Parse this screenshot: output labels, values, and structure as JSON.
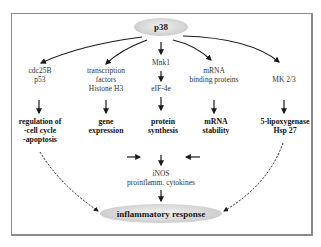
{
  "diagram": {
    "root": {
      "label": "p38"
    },
    "branches": [
      {
        "id": "cdc25b",
        "lines": [
          "cdc25B",
          "p53"
        ]
      },
      {
        "id": "tf",
        "lines": [
          "transcription",
          "factors",
          "Histone H3"
        ]
      },
      {
        "id": "mnk1",
        "lines": [
          "Mnk1"
        ]
      },
      {
        "id": "mrna-bp",
        "lines": [
          "mRNA",
          "binding proteins"
        ]
      },
      {
        "id": "mk23",
        "lines": [
          "MK 2/3"
        ]
      }
    ],
    "intermediate": {
      "eif4e": {
        "lines": [
          "eIF-4e"
        ]
      },
      "inos": {
        "lines": [
          "iNOS",
          "proinflamm. cytokines"
        ]
      }
    },
    "outcomes": [
      {
        "id": "regulation",
        "lines": [
          "regulation of",
          "-cell cycle",
          "-apoptosis"
        ]
      },
      {
        "id": "gene-expression",
        "lines": [
          "gene",
          "expression"
        ]
      },
      {
        "id": "protein-synthesis",
        "lines": [
          "protein",
          "synthesis"
        ]
      },
      {
        "id": "mrna-stability",
        "lines": [
          "mRNA",
          "stability"
        ]
      },
      {
        "id": "lipoxygenase",
        "lines": [
          "5-lipoxygenase",
          "Hsp 27"
        ]
      }
    ],
    "sink": {
      "label": "inflammatory response"
    },
    "edges": [
      {
        "from": "p38",
        "to": "cdc25B/p53",
        "style": "solid"
      },
      {
        "from": "p38",
        "to": "transcription factors",
        "style": "solid"
      },
      {
        "from": "p38",
        "to": "Mnk1",
        "style": "solid"
      },
      {
        "from": "p38",
        "to": "mRNA binding proteins",
        "style": "solid"
      },
      {
        "from": "p38",
        "to": "MK 2/3",
        "style": "solid"
      },
      {
        "from": "Mnk1",
        "to": "eIF-4e",
        "style": "solid"
      },
      {
        "from": "eIF-4e",
        "to": "protein synthesis",
        "style": "solid"
      },
      {
        "from": "cdc25B/p53",
        "to": "regulation of cell cycle/apoptosis",
        "style": "solid"
      },
      {
        "from": "transcription factors",
        "to": "gene expression",
        "style": "solid"
      },
      {
        "from": "mRNA binding proteins",
        "to": "mRNA stability",
        "style": "solid"
      },
      {
        "from": "MK 2/3",
        "to": "5-lipoxygenase/Hsp 27",
        "style": "solid"
      },
      {
        "from": "gene expression",
        "to": "protein synthesis",
        "style": "solid"
      },
      {
        "from": "mRNA stability",
        "to": "protein synthesis",
        "style": "solid"
      },
      {
        "from": "protein synthesis",
        "to": "iNOS/proinflamm. cytokines",
        "style": "solid"
      },
      {
        "from": "iNOS/proinflamm. cytokines",
        "to": "inflammatory response",
        "style": "solid"
      },
      {
        "from": "regulation of cell cycle/apoptosis",
        "to": "inflammatory response",
        "style": "dashed"
      },
      {
        "from": "5-lipoxygenase/Hsp 27",
        "to": "inflammatory response",
        "style": "dashed"
      }
    ]
  }
}
